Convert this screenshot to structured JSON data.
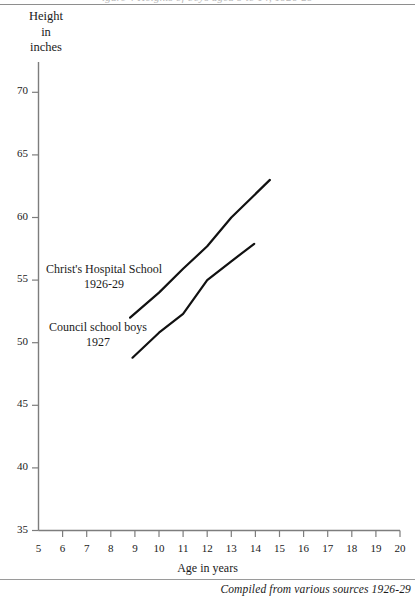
{
  "page": {
    "cropped_header_text": "igure 4 Heights of boys aged 9 to 14, 1926-29",
    "source_caption": "Compiled from various sources 1926-29"
  },
  "axes": {
    "y_title": "Height\nin\ninches",
    "x_title": "Age in years",
    "y_ticks": [
      70,
      65,
      60,
      55,
      50,
      45,
      40,
      35
    ],
    "x_ticks": [
      5,
      6,
      7,
      8,
      9,
      10,
      11,
      12,
      13,
      14,
      15,
      16,
      17,
      18,
      19,
      20
    ]
  },
  "annotations": {
    "christs_hospital": "Christ's Hospital School\n1926-29",
    "council_boys": "Council school boys\n1927"
  },
  "chart_data": {
    "type": "line",
    "title": "Heights of boys aged 9 to 14, 1926-29",
    "xlabel": "Age in years",
    "ylabel": "Height in inches",
    "xlim": [
      5,
      20
    ],
    "ylim": [
      35,
      70
    ],
    "grid": false,
    "legend": "inline-annotations",
    "series": [
      {
        "name": "Christ's Hospital School 1926-29",
        "color": "#111111",
        "x": [
          8.8,
          10.0,
          11.0,
          12.0,
          13.0,
          14.6
        ],
        "y": [
          52.0,
          54.0,
          55.9,
          57.7,
          60.0,
          63.0
        ]
      },
      {
        "name": "Council school boys 1927",
        "color": "#111111",
        "x": [
          8.9,
          10.0,
          11.0,
          12.0,
          13.0,
          13.95
        ],
        "y": [
          48.8,
          50.8,
          52.3,
          55.0,
          56.5,
          57.9
        ]
      }
    ]
  }
}
